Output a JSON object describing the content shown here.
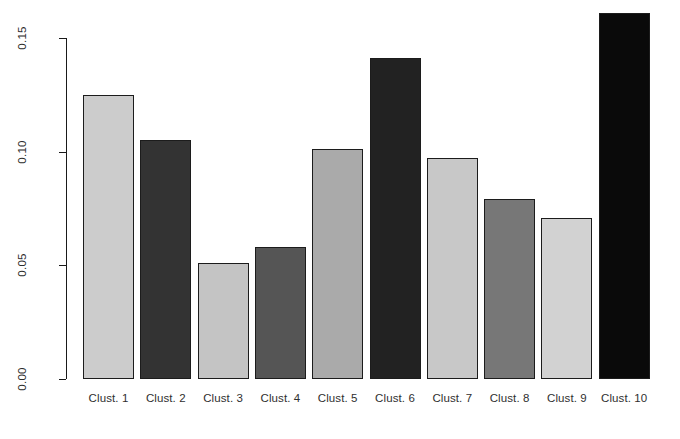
{
  "chart_data": {
    "type": "bar",
    "title": "",
    "subtitle": "",
    "xlabel": "",
    "ylabel": "",
    "categories": [
      "Clust. 1",
      "Clust. 2",
      "Clust. 3",
      "Clust. 4",
      "Clust. 5",
      "Clust. 6",
      "Clust. 7",
      "Clust. 8",
      "Clust. 9",
      "Clust. 10"
    ],
    "values": [
      0.125,
      0.105,
      0.051,
      0.058,
      0.101,
      0.141,
      0.097,
      0.079,
      0.071,
      0.161
    ],
    "bar_colors": [
      "#cccccc",
      "#333333",
      "#c4c4c4",
      "#555555",
      "#aaaaaa",
      "#222222",
      "#c8c8c8",
      "#777777",
      "#d2d2d2",
      "#0a0a0a"
    ],
    "bar_border_color": "#1c1c1c",
    "ylim": [
      0.0,
      0.165
    ],
    "ytick_values": [
      0.0,
      0.05,
      0.1,
      0.15
    ],
    "ytick_labels": [
      "0.00",
      "0.05",
      "0.10",
      "0.15"
    ],
    "grid": false,
    "legend": null,
    "axis_color": "#1a1a1a",
    "background": "#ffffff"
  }
}
